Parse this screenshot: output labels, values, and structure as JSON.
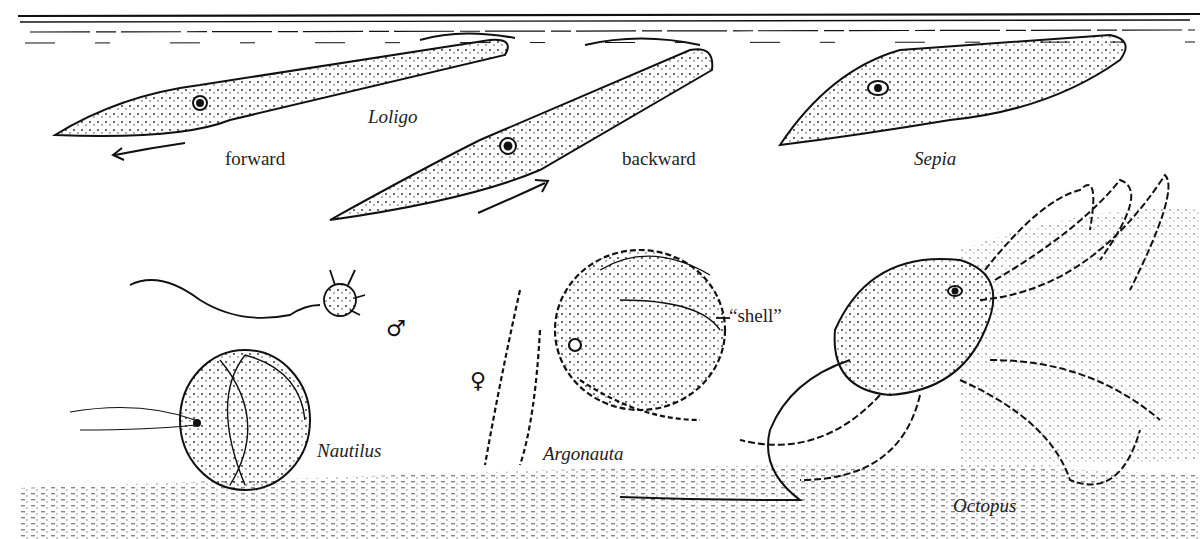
{
  "figure": {
    "colors": {
      "ink": "#111111",
      "paper": "#ffffff"
    }
  },
  "labels": {
    "loligo": "Loligo",
    "forward": "forward",
    "backward": "backward",
    "sepia": "Sepia",
    "nautilus": "Nautilus",
    "argonauta": "Argonauta",
    "shell": "“shell”",
    "octopus": "Octopus",
    "male_symbol": "♂",
    "female_symbol": "♀"
  }
}
